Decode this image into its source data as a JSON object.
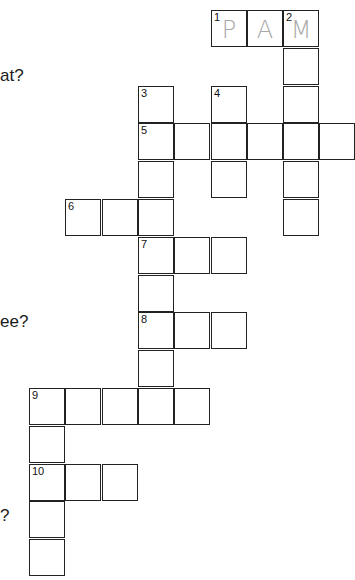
{
  "puzzle": {
    "clue_fragments": [
      {
        "text": "at?",
        "x": 0,
        "y": 66
      },
      {
        "text": "ee?",
        "x": 0,
        "y": 312
      },
      {
        "text": "?",
        "x": 0,
        "y": 506
      }
    ],
    "grid_origin": {
      "x": 29,
      "y": 10
    },
    "cell_size": {
      "w": 36.3,
      "h": 37.8
    },
    "cells": [
      {
        "r": 0,
        "c": 5,
        "num": "1",
        "letter": "P"
      },
      {
        "r": 0,
        "c": 6,
        "num": "",
        "letter": "A"
      },
      {
        "r": 0,
        "c": 7,
        "num": "2",
        "letter": "M"
      },
      {
        "r": 1,
        "c": 7,
        "num": "",
        "letter": ""
      },
      {
        "r": 2,
        "c": 7,
        "num": "",
        "letter": ""
      },
      {
        "r": 3,
        "c": 7,
        "num": "",
        "letter": ""
      },
      {
        "r": 4,
        "c": 7,
        "num": "",
        "letter": ""
      },
      {
        "r": 5,
        "c": 7,
        "num": "",
        "letter": ""
      },
      {
        "r": 2,
        "c": 3,
        "num": "3",
        "letter": ""
      },
      {
        "r": 2,
        "c": 5,
        "num": "4",
        "letter": ""
      },
      {
        "r": 3,
        "c": 3,
        "num": "5",
        "letter": ""
      },
      {
        "r": 3,
        "c": 4,
        "num": "",
        "letter": ""
      },
      {
        "r": 3,
        "c": 5,
        "num": "",
        "letter": ""
      },
      {
        "r": 3,
        "c": 6,
        "num": "",
        "letter": ""
      },
      {
        "r": 3,
        "c": 8,
        "num": "",
        "letter": ""
      },
      {
        "r": 4,
        "c": 3,
        "num": "",
        "letter": ""
      },
      {
        "r": 4,
        "c": 5,
        "num": "",
        "letter": ""
      },
      {
        "r": 5,
        "c": 1,
        "num": "6",
        "letter": ""
      },
      {
        "r": 5,
        "c": 2,
        "num": "",
        "letter": ""
      },
      {
        "r": 5,
        "c": 3,
        "num": "",
        "letter": ""
      },
      {
        "r": 6,
        "c": 3,
        "num": "7",
        "letter": ""
      },
      {
        "r": 6,
        "c": 4,
        "num": "",
        "letter": ""
      },
      {
        "r": 6,
        "c": 5,
        "num": "",
        "letter": ""
      },
      {
        "r": 7,
        "c": 3,
        "num": "",
        "letter": ""
      },
      {
        "r": 8,
        "c": 3,
        "num": "8",
        "letter": ""
      },
      {
        "r": 8,
        "c": 4,
        "num": "",
        "letter": ""
      },
      {
        "r": 8,
        "c": 5,
        "num": "",
        "letter": ""
      },
      {
        "r": 9,
        "c": 3,
        "num": "",
        "letter": ""
      },
      {
        "r": 10,
        "c": 0,
        "num": "9",
        "letter": ""
      },
      {
        "r": 10,
        "c": 1,
        "num": "",
        "letter": ""
      },
      {
        "r": 10,
        "c": 2,
        "num": "",
        "letter": ""
      },
      {
        "r": 10,
        "c": 3,
        "num": "",
        "letter": ""
      },
      {
        "r": 10,
        "c": 4,
        "num": "",
        "letter": ""
      },
      {
        "r": 11,
        "c": 0,
        "num": "",
        "letter": ""
      },
      {
        "r": 12,
        "c": 0,
        "num": "10",
        "letter": ""
      },
      {
        "r": 12,
        "c": 1,
        "num": "",
        "letter": ""
      },
      {
        "r": 12,
        "c": 2,
        "num": "",
        "letter": ""
      },
      {
        "r": 13,
        "c": 0,
        "num": "",
        "letter": ""
      },
      {
        "r": 14,
        "c": 0,
        "num": "",
        "letter": ""
      }
    ],
    "colors": {
      "line": "#222222",
      "filled_letter": "#a8a8a8",
      "background": "#ffffff"
    }
  }
}
